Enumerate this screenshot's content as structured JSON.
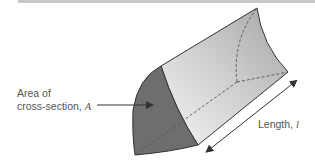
{
  "figure": {
    "labels": {
      "area_line1": "Area of",
      "area_line2": "cross-section, ",
      "area_symbol": "A",
      "length_text": "Length, ",
      "length_symbol": "l"
    },
    "colors": {
      "cross_section_fill": "#6e6e6e",
      "side_fill_light": "#f2f2f2",
      "side_fill_dark": "#a9a9a9",
      "outline": "#333333",
      "dashed": "#555555",
      "top_bar": "#c8c8c8"
    }
  }
}
